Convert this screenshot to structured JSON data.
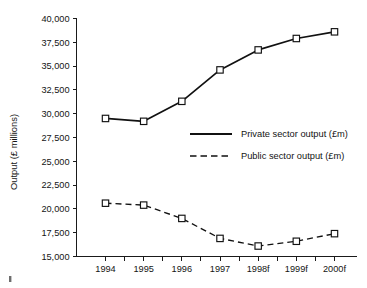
{
  "chart_data": {
    "type": "line",
    "title": "",
    "xlabel": "",
    "ylabel": "Output (£ millions)",
    "categories": [
      "1994",
      "1995",
      "1996",
      "1997",
      "1998f",
      "1999f",
      "2000f"
    ],
    "ylim": [
      15000,
      40000
    ],
    "ytick_values": [
      15000,
      17500,
      20000,
      22500,
      25000,
      27500,
      30000,
      32500,
      35000,
      37500,
      40000
    ],
    "ytick_labels": [
      "15,000",
      "17,500",
      "20,000",
      "22,500",
      "25,000",
      "27,500",
      "30,000",
      "32,500",
      "35,000",
      "37,500",
      "40,000"
    ],
    "grid": false,
    "legend_position": "center-right-inside",
    "series": [
      {
        "name": "Private sector output (£m)",
        "style": "solid",
        "marker": "open-square",
        "values": [
          29500,
          29200,
          31300,
          34600,
          36700,
          37900,
          38600
        ]
      },
      {
        "name": "Public sector output (£m)",
        "style": "dashed",
        "marker": "open-square",
        "values": [
          20600,
          20400,
          19000,
          16900,
          16100,
          16600,
          17400
        ]
      }
    ]
  },
  "legend": {
    "entries": [
      {
        "label": "Private sector output (£m)",
        "style": "solid"
      },
      {
        "label": "Public sector output (£m)",
        "style": "dashed"
      }
    ]
  },
  "colors": {
    "line": "#111111",
    "axis": "#1a1a1a",
    "text": "#141414",
    "background": "#ffffff",
    "marker_fill": "#ffffff"
  }
}
